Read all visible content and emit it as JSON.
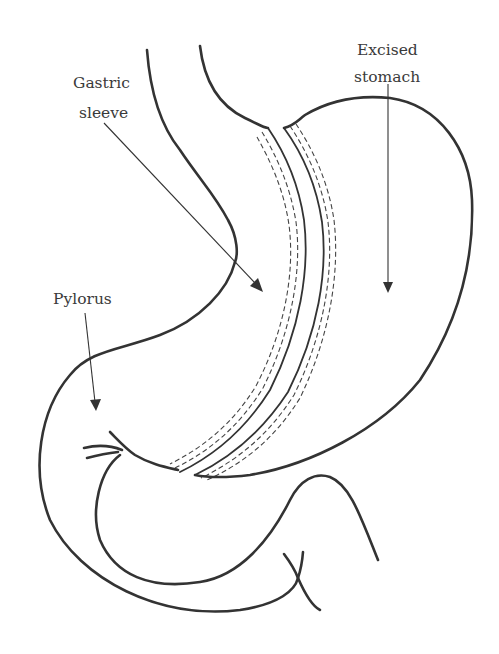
{
  "diagram": {
    "labels": {
      "gastric_sleeve_line1": "Gastric",
      "gastric_sleeve_line2": "sleeve",
      "excised_stomach_line1": "Excised",
      "excised_stomach_line2": "stomach",
      "pylorus": "Pylorus"
    },
    "colors": {
      "line": "#333333",
      "text": "#3a3a3a",
      "background": "#ffffff"
    }
  }
}
